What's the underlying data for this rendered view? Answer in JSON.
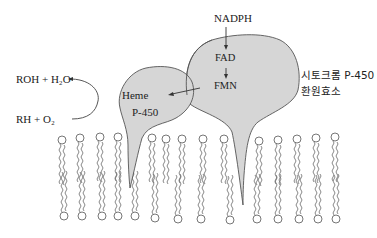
{
  "diagram": {
    "labels": {
      "roh_h2o": "ROH + H₂O",
      "rh_o2": "RH + O₂",
      "heme": "Heme",
      "p450": "P-450",
      "nadph": "NADPH",
      "fad": "FAD",
      "fmn": "FMN",
      "reductase_line1": "시토크롬 P-450",
      "reductase_line2": "환원효소"
    },
    "colors": {
      "protein_fill": "#d6d6d6",
      "outline": "#555555",
      "lipid": "#666666",
      "background": "#ffffff"
    },
    "membrane": {
      "top_heads_x": [
        62,
        80,
        100,
        118,
        152,
        166,
        182,
        203,
        224,
        259,
        278,
        297,
        316,
        335
      ],
      "bottom_heads_x": [
        64,
        82,
        102,
        118,
        135,
        155,
        178,
        201,
        230,
        257,
        278,
        299,
        318,
        336
      ]
    }
  }
}
